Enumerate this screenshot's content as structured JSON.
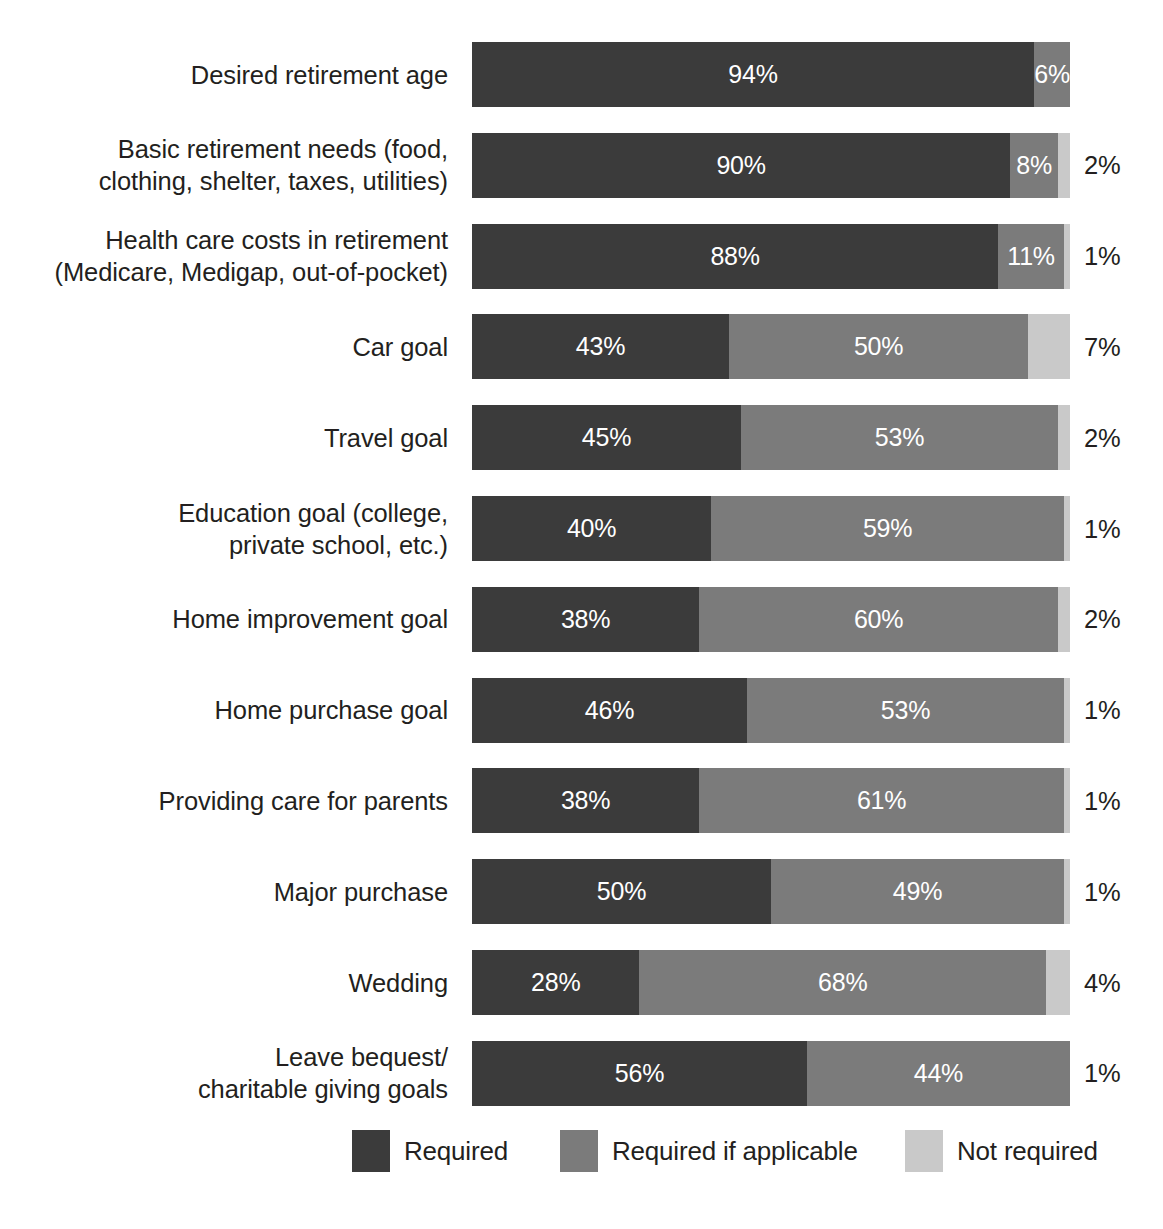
{
  "chart_data": {
    "type": "bar",
    "subtype": "stacked-horizontal-100",
    "title": "",
    "xlabel": "",
    "ylabel": "",
    "xlim": [
      0,
      100
    ],
    "grid": false,
    "legend_position": "bottom",
    "legend": [
      "Required",
      "Required if applicable",
      "Not required"
    ],
    "series": [
      {
        "name": "Required",
        "color": "#3b3b3b",
        "values": [
          94,
          90,
          88,
          43,
          45,
          40,
          38,
          46,
          38,
          50,
          28,
          56
        ]
      },
      {
        "name": "Required if applicable",
        "color": "#7b7b7b",
        "values": [
          6,
          8,
          11,
          50,
          53,
          59,
          60,
          53,
          61,
          49,
          68,
          44
        ]
      },
      {
        "name": "Not required",
        "color": "#c9c9c9",
        "values": [
          0,
          2,
          1,
          7,
          2,
          1,
          2,
          1,
          1,
          1,
          4,
          1
        ]
      }
    ],
    "categories": [
      "Desired retirement age",
      "Basic retirement needs (food,\nclothing, shelter, taxes, utilities)",
      "Health care costs in retirement\n(Medicare, Medigap, out-of-pocket)",
      "Car goal",
      "Travel goal",
      "Education goal (college,\nprivate school, etc.)",
      "Home improvement goal",
      "Home purchase goal",
      "Providing care for parents",
      "Major purchase",
      "Wedding",
      "Leave bequest/\ncharitable giving goals"
    ]
  },
  "rows": [
    {
      "label": "Desired retirement age",
      "segments": [
        {
          "series": 0,
          "value": 94,
          "text": "94%",
          "inside": true
        },
        {
          "series": 1,
          "value": 6,
          "text": "6%",
          "inside": true
        }
      ],
      "outside_label": ""
    },
    {
      "label": "Basic retirement needs (food,\nclothing, shelter, taxes, utilities)",
      "segments": [
        {
          "series": 0,
          "value": 90,
          "text": "90%",
          "inside": true
        },
        {
          "series": 1,
          "value": 8,
          "text": "8%",
          "inside": true
        },
        {
          "series": 2,
          "value": 2,
          "text": "2%",
          "inside": false
        }
      ],
      "outside_label": "2%"
    },
    {
      "label": "Health care costs in retirement\n(Medicare, Medigap, out-of-pocket)",
      "segments": [
        {
          "series": 0,
          "value": 88,
          "text": "88%",
          "inside": true
        },
        {
          "series": 1,
          "value": 11,
          "text": "11%",
          "inside": true
        },
        {
          "series": 2,
          "value": 1,
          "text": "1%",
          "inside": false
        }
      ],
      "outside_label": "1%"
    },
    {
      "label": "Car goal",
      "segments": [
        {
          "series": 0,
          "value": 43,
          "text": "43%",
          "inside": true
        },
        {
          "series": 1,
          "value": 50,
          "text": "50%",
          "inside": true
        },
        {
          "series": 2,
          "value": 7,
          "text": "7%",
          "inside": false
        }
      ],
      "outside_label": "7%"
    },
    {
      "label": "Travel goal",
      "segments": [
        {
          "series": 0,
          "value": 45,
          "text": "45%",
          "inside": true
        },
        {
          "series": 1,
          "value": 53,
          "text": "53%",
          "inside": true
        },
        {
          "series": 2,
          "value": 2,
          "text": "2%",
          "inside": false
        }
      ],
      "outside_label": "2%"
    },
    {
      "label": "Education goal (college,\nprivate school, etc.)",
      "segments": [
        {
          "series": 0,
          "value": 40,
          "text": "40%",
          "inside": true
        },
        {
          "series": 1,
          "value": 59,
          "text": "59%",
          "inside": true
        },
        {
          "series": 2,
          "value": 1,
          "text": "1%",
          "inside": false
        }
      ],
      "outside_label": "1%"
    },
    {
      "label": "Home improvement goal",
      "segments": [
        {
          "series": 0,
          "value": 38,
          "text": "38%",
          "inside": true
        },
        {
          "series": 1,
          "value": 60,
          "text": "60%",
          "inside": true
        },
        {
          "series": 2,
          "value": 2,
          "text": "2%",
          "inside": false
        }
      ],
      "outside_label": "2%"
    },
    {
      "label": "Home purchase goal",
      "segments": [
        {
          "series": 0,
          "value": 46,
          "text": "46%",
          "inside": true
        },
        {
          "series": 1,
          "value": 53,
          "text": "53%",
          "inside": true
        },
        {
          "series": 2,
          "value": 1,
          "text": "1%",
          "inside": false
        }
      ],
      "outside_label": "1%"
    },
    {
      "label": "Providing care for parents",
      "segments": [
        {
          "series": 0,
          "value": 38,
          "text": "38%",
          "inside": true
        },
        {
          "series": 1,
          "value": 61,
          "text": "61%",
          "inside": true
        },
        {
          "series": 2,
          "value": 1,
          "text": "1%",
          "inside": false
        }
      ],
      "outside_label": "1%"
    },
    {
      "label": "Major purchase",
      "segments": [
        {
          "series": 0,
          "value": 50,
          "text": "50%",
          "inside": true
        },
        {
          "series": 1,
          "value": 49,
          "text": "49%",
          "inside": true
        },
        {
          "series": 2,
          "value": 1,
          "text": "1%",
          "inside": false
        }
      ],
      "outside_label": "1%"
    },
    {
      "label": "Wedding",
      "segments": [
        {
          "series": 0,
          "value": 28,
          "text": "28%",
          "inside": true
        },
        {
          "series": 1,
          "value": 68,
          "text": "68%",
          "inside": true
        },
        {
          "series": 2,
          "value": 4,
          "text": "4%",
          "inside": false
        }
      ],
      "outside_label": "4%"
    },
    {
      "label": "Leave bequest/\ncharitable giving goals",
      "segments": [
        {
          "series": 0,
          "value": 56,
          "text": "56%",
          "inside": true
        },
        {
          "series": 1,
          "value": 44,
          "text": "44%",
          "inside": true
        },
        {
          "series": 2,
          "value": 1,
          "text": "1%",
          "inside": false
        }
      ],
      "outside_label": "1%"
    }
  ],
  "legend": {
    "items": [
      {
        "label": "Required",
        "color": "#3b3b3b"
      },
      {
        "label": "Required if applicable",
        "color": "#7b7b7b"
      },
      {
        "label": "Not required",
        "color": "#c9c9c9"
      }
    ]
  }
}
